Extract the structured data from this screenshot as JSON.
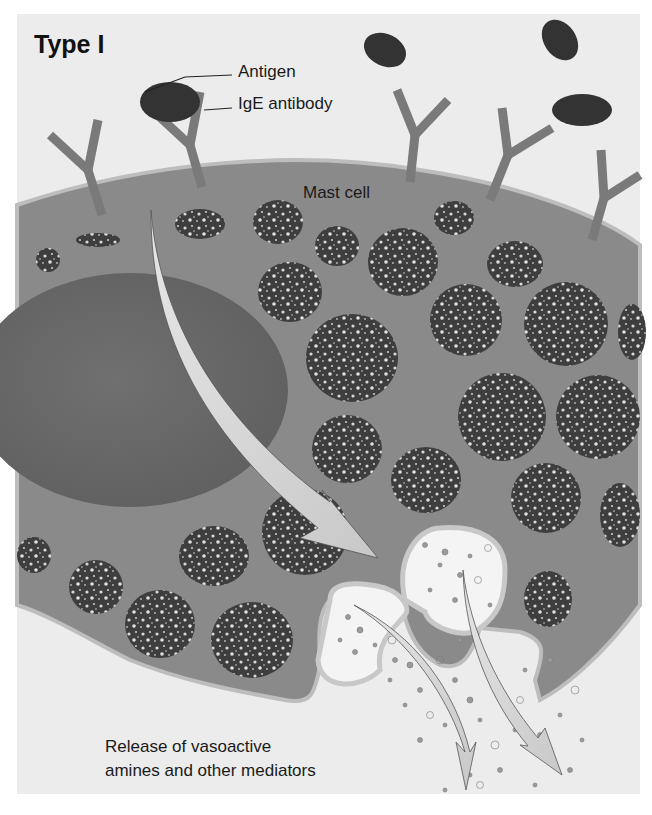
{
  "figure": {
    "title": "Type I",
    "labels": {
      "antigen": "Antigen",
      "ige_antibody": "IgE antibody",
      "mast_cell": "Mast cell",
      "release_line1": "Release of vasoactive",
      "release_line2": "amines and other mediators"
    },
    "colors": {
      "background": "#ececec",
      "cytoplasm": "#8a8a8a",
      "membrane": "#b8b8b8",
      "nucleus": "#6c6c6c",
      "granule": "#3e3e3e",
      "granule_dot": "#d8d8d8",
      "antigen": "#333333",
      "antibody": "#7a7a7a",
      "arrow": "#dcdcdc",
      "vesicle": "#f4f4f4"
    }
  }
}
